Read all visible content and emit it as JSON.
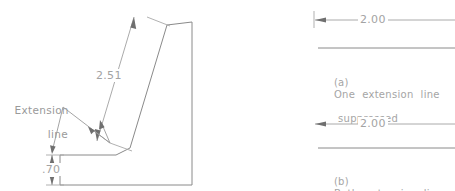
{
  "figure": {
    "title_hidden": "",
    "left_drawing": {
      "name": "inclined-surface-part-drawing",
      "dimensions": [
        {
          "id": "inclined",
          "value": "2.51",
          "orientation": "inclined",
          "description": "true length of inclined surface"
        },
        {
          "id": "height",
          "value": ".70",
          "orientation": "vertical",
          "description": "base height"
        }
      ],
      "annotations": [
        {
          "id": "extension-line-callout",
          "line1": "Extension",
          "line2": "line"
        }
      ]
    },
    "right_examples": [
      {
        "id": "example-a",
        "dimension_value": "2.00",
        "marker": "(a)",
        "caption_line1": "One  extension  line",
        "caption_line2": "suppressed",
        "extension_lines_suppressed": 1
      },
      {
        "id": "example-b",
        "dimension_value": "2.00",
        "marker": "(b)",
        "caption_line1": "Both  extension  lines",
        "caption_line2": "suppressed",
        "extension_lines_suppressed": 2
      }
    ]
  },
  "colors": {
    "object_line": "#8a8a8a",
    "dimension_line": "#a0a0a0",
    "extension_line": "#a8a8a8",
    "arrowhead": "#6f6f6f",
    "text": "#9a9a9a",
    "background": "#ffffff"
  }
}
